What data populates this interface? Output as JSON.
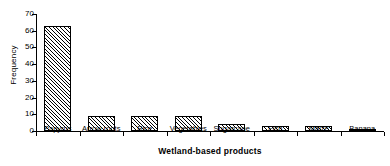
{
  "chart_data": {
    "type": "bar",
    "title": "",
    "xlabel": "Wetland-based products",
    "ylabel": "Frequency",
    "categories": [
      "Papyrus",
      "Arrow roots",
      "Rice",
      "Vegetables",
      "Sugarcane",
      "Fish",
      "Maize",
      "Banana"
    ],
    "values": [
      63,
      9,
      9,
      9,
      4,
      3,
      3,
      1.5
    ],
    "ylim": [
      0,
      70
    ],
    "yticks": [
      0,
      10,
      20,
      30,
      40,
      50,
      60,
      70
    ],
    "ytick_labels": [
      "0",
      "10",
      "20",
      "30",
      "40",
      "50",
      "60",
      "70"
    ],
    "grid": false,
    "legend": null,
    "bar_fill": "diagonal-hatch",
    "bar_edge_color": "#000000",
    "bar_face_color": "#ffffff",
    "background_color": "#ffffff",
    "text_color": "#000000"
  }
}
